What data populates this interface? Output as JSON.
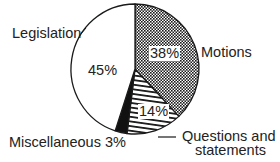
{
  "chart_data": {
    "type": "pie",
    "title": "",
    "start_angle_deg": 0,
    "direction": "clockwise",
    "slices": [
      {
        "label": "Motions",
        "value": 38,
        "value_label": "38%",
        "pattern": "crosshatch-dots"
      },
      {
        "label": "Questions and statements",
        "value": 14,
        "value_label": "14%",
        "pattern": "horizontal-lines"
      },
      {
        "label": "Miscellaneous",
        "value": 3,
        "value_label": "3%",
        "pattern": "solid-black"
      },
      {
        "label": "Legislation",
        "value": 45,
        "value_label": "45%",
        "pattern": "white"
      }
    ]
  },
  "labels": {
    "legislation": "Legislation",
    "motions": "Motions",
    "questions_line1": "Questions and",
    "questions_line2": "statements",
    "miscellaneous": "Miscellaneous 3%"
  },
  "percents": {
    "legislation": "45%",
    "motions": "38%",
    "questions": "14%"
  },
  "colors": {
    "ink": "#1a1a1a",
    "background": "#ffffff"
  }
}
